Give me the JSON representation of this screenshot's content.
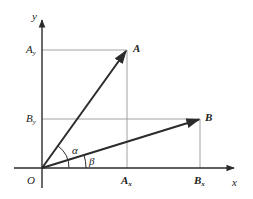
{
  "diagram": {
    "axes": {
      "x_label": "x",
      "y_label": "y",
      "origin_label": "O"
    },
    "vectors": [
      {
        "name": "A",
        "label": "A"
      },
      {
        "name": "B",
        "label": "B"
      }
    ],
    "projections": {
      "A_x": "A",
      "A_x_sub": "x",
      "A_y": "A",
      "A_y_sub": "y",
      "B_x": "B",
      "B_x_sub": "x",
      "B_y": "B",
      "B_y_sub": "y"
    },
    "angles": {
      "alpha": "α",
      "beta": "β"
    },
    "colors": {
      "line": "#2b2b2b",
      "guide": "#8a8a8a"
    }
  }
}
